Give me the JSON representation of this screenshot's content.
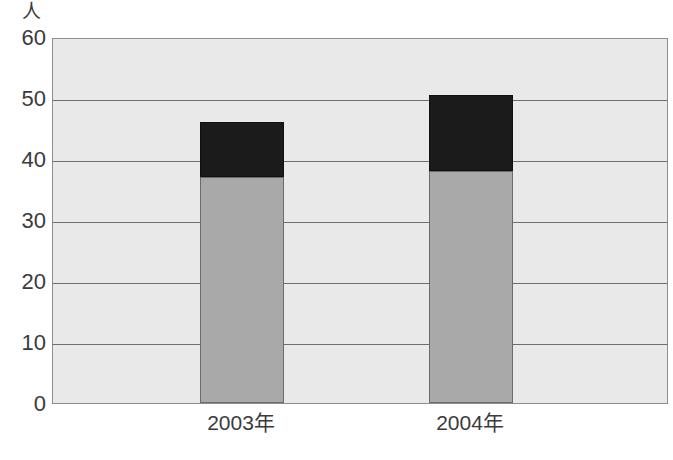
{
  "chart_data": {
    "type": "bar",
    "subtype": "stacked-bar",
    "title": "",
    "xlabel": "",
    "ylabel": "人",
    "yunit_label": "人",
    "ylim": [
      0,
      60
    ],
    "ytick_values": [
      0,
      10,
      20,
      30,
      40,
      50,
      60
    ],
    "ytick_labels": [
      "0",
      "10",
      "20",
      "30",
      "40",
      "50",
      "60"
    ],
    "grid": true,
    "grid_axis": "y",
    "legend": false,
    "legend_position": "none",
    "categories": [
      "2003年",
      "2004年"
    ],
    "series": [
      {
        "name": "lower-segment",
        "color": "#a9a9a9",
        "values": [
          37,
          38
        ]
      },
      {
        "name": "upper-segment",
        "color": "#1b1b1b",
        "values": [
          9,
          12.5
        ]
      }
    ],
    "totals": [
      46,
      50.5
    ],
    "plot_background_color": "#e9e9e9",
    "gridline_color": "#6e6e6e",
    "axis_color": "#8d8d8d",
    "text_color": "#3b3b3b"
  }
}
